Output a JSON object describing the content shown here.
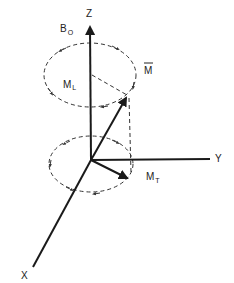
{
  "diagram": {
    "type": "vector-precession-3d",
    "axes": {
      "z_label": "Z",
      "y_label": "Y",
      "x_label": "X"
    },
    "field_label": {
      "main": "B",
      "sub": "O"
    },
    "magnetization_label": "M",
    "magnetization_overbar": true,
    "longitudinal_label": {
      "main": "M",
      "sub": "L"
    },
    "transverse_label": {
      "main": "M",
      "sub": "T"
    },
    "colors": {
      "ink": "#1a1a1a",
      "background": "#ffffff"
    }
  }
}
